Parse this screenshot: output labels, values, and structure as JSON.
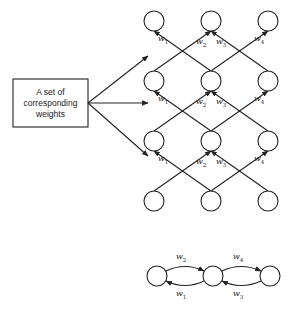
{
  "box": {
    "lines": [
      "A set of",
      "corresponding",
      "weights"
    ]
  },
  "weights": {
    "w1": {
      "base": "w",
      "sub": "1"
    },
    "w2": {
      "base": "w",
      "sub": "2"
    },
    "w3": {
      "base": "w",
      "sub": "3"
    },
    "w4": {
      "base": "w",
      "sub": "4"
    }
  },
  "grid": {
    "columns_x": [
      154,
      211,
      268
    ],
    "rows_y": [
      21,
      81,
      141,
      201
    ],
    "node_radius": 10
  },
  "chain": {
    "nodes_x": [
      157,
      213,
      270
    ],
    "y": 276,
    "top_labels": [
      "w2",
      "w4"
    ],
    "bottom_labels": [
      "w1",
      "w3"
    ]
  },
  "colors": {
    "stroke": "#222222",
    "background": "#ffffff"
  }
}
